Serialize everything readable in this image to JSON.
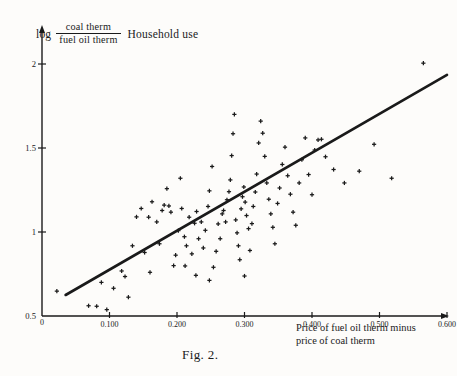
{
  "figure": {
    "caption": "Fig. 2.",
    "title_prefix": "log",
    "title_numerator": "coal therm",
    "title_denominator": "fuel oil therm",
    "title_suffix": "Household use",
    "xlabel_line1": "Price of fuel oil therm minus",
    "xlabel_line2": "price of coal therm",
    "origin_label": "0",
    "ink_color": "#1a1a1a",
    "paper_color": "#fdfcfa"
  },
  "chart_data": {
    "type": "scatter",
    "xlabel": "Price of fuel oil therm minus price of coal therm",
    "ylabel": "log (coal therm / fuel oil therm)",
    "xlim": [
      0.0,
      0.62
    ],
    "ylim": [
      0.5,
      2.12
    ],
    "grid": false,
    "legend": null,
    "xticks": [
      0.1,
      0.2,
      0.3,
      0.4,
      0.5,
      0.6
    ],
    "xtick_labels": [
      "0.100",
      "0.200",
      "0.300",
      "0.400",
      "0.500",
      "0.600"
    ],
    "yticks": [
      0.5,
      1.0,
      1.5,
      2.0
    ],
    "ytick_labels": [
      "0.5",
      "1",
      "1.5",
      "2"
    ],
    "marker": "plus",
    "fit_line": {
      "label": "fitted regression line",
      "x": [
        0.035,
        0.6
      ],
      "y": [
        0.625,
        1.935
      ]
    },
    "points": [
      {
        "x": 0.022,
        "y": 0.648
      },
      {
        "x": 0.069,
        "y": 0.561
      },
      {
        "x": 0.081,
        "y": 0.558
      },
      {
        "x": 0.096,
        "y": 0.538
      },
      {
        "x": 0.088,
        "y": 0.7
      },
      {
        "x": 0.106,
        "y": 0.665
      },
      {
        "x": 0.118,
        "y": 0.768
      },
      {
        "x": 0.123,
        "y": 0.735
      },
      {
        "x": 0.134,
        "y": 0.918
      },
      {
        "x": 0.14,
        "y": 1.09
      },
      {
        "x": 0.147,
        "y": 1.14
      },
      {
        "x": 0.152,
        "y": 0.878
      },
      {
        "x": 0.158,
        "y": 1.088
      },
      {
        "x": 0.163,
        "y": 1.18
      },
      {
        "x": 0.17,
        "y": 1.06
      },
      {
        "x": 0.174,
        "y": 0.93
      },
      {
        "x": 0.178,
        "y": 1.128
      },
      {
        "x": 0.181,
        "y": 1.16
      },
      {
        "x": 0.185,
        "y": 1.258
      },
      {
        "x": 0.188,
        "y": 1.155
      },
      {
        "x": 0.191,
        "y": 1.118
      },
      {
        "x": 0.195,
        "y": 0.8
      },
      {
        "x": 0.198,
        "y": 0.862
      },
      {
        "x": 0.202,
        "y": 1.008
      },
      {
        "x": 0.205,
        "y": 1.32
      },
      {
        "x": 0.207,
        "y": 1.14
      },
      {
        "x": 0.211,
        "y": 0.972
      },
      {
        "x": 0.214,
        "y": 0.918
      },
      {
        "x": 0.218,
        "y": 1.088
      },
      {
        "x": 0.222,
        "y": 0.87
      },
      {
        "x": 0.226,
        "y": 1.052
      },
      {
        "x": 0.229,
        "y": 1.122
      },
      {
        "x": 0.232,
        "y": 0.96
      },
      {
        "x": 0.236,
        "y": 1.06
      },
      {
        "x": 0.239,
        "y": 0.905
      },
      {
        "x": 0.242,
        "y": 1.01
      },
      {
        "x": 0.246,
        "y": 1.152
      },
      {
        "x": 0.248,
        "y": 1.245
      },
      {
        "x": 0.252,
        "y": 1.39
      },
      {
        "x": 0.254,
        "y": 0.79
      },
      {
        "x": 0.258,
        "y": 0.885
      },
      {
        "x": 0.261,
        "y": 1.048
      },
      {
        "x": 0.264,
        "y": 0.96
      },
      {
        "x": 0.267,
        "y": 1.108
      },
      {
        "x": 0.269,
        "y": 1.128
      },
      {
        "x": 0.272,
        "y": 1.06
      },
      {
        "x": 0.274,
        "y": 1.192
      },
      {
        "x": 0.277,
        "y": 1.24
      },
      {
        "x": 0.279,
        "y": 1.31
      },
      {
        "x": 0.281,
        "y": 1.455
      },
      {
        "x": 0.283,
        "y": 1.585
      },
      {
        "x": 0.285,
        "y": 1.7
      },
      {
        "x": 0.287,
        "y": 1.072
      },
      {
        "x": 0.289,
        "y": 0.995
      },
      {
        "x": 0.291,
        "y": 0.918
      },
      {
        "x": 0.293,
        "y": 0.835
      },
      {
        "x": 0.295,
        "y": 1.138
      },
      {
        "x": 0.297,
        "y": 1.21
      },
      {
        "x": 0.299,
        "y": 1.268
      },
      {
        "x": 0.301,
        "y": 1.178
      },
      {
        "x": 0.303,
        "y": 1.098
      },
      {
        "x": 0.306,
        "y": 1.02
      },
      {
        "x": 0.308,
        "y": 0.89
      },
      {
        "x": 0.311,
        "y": 1.05
      },
      {
        "x": 0.313,
        "y": 1.152
      },
      {
        "x": 0.316,
        "y": 1.238
      },
      {
        "x": 0.318,
        "y": 1.345
      },
      {
        "x": 0.321,
        "y": 1.53
      },
      {
        "x": 0.324,
        "y": 1.66
      },
      {
        "x": 0.327,
        "y": 1.588
      },
      {
        "x": 0.33,
        "y": 1.45
      },
      {
        "x": 0.333,
        "y": 1.292
      },
      {
        "x": 0.336,
        "y": 1.195
      },
      {
        "x": 0.339,
        "y": 1.108
      },
      {
        "x": 0.342,
        "y": 1.028
      },
      {
        "x": 0.345,
        "y": 0.93
      },
      {
        "x": 0.349,
        "y": 1.17
      },
      {
        "x": 0.352,
        "y": 1.262
      },
      {
        "x": 0.356,
        "y": 1.402
      },
      {
        "x": 0.36,
        "y": 1.505
      },
      {
        "x": 0.364,
        "y": 1.335
      },
      {
        "x": 0.368,
        "y": 1.225
      },
      {
        "x": 0.372,
        "y": 1.118
      },
      {
        "x": 0.376,
        "y": 1.04
      },
      {
        "x": 0.381,
        "y": 1.292
      },
      {
        "x": 0.385,
        "y": 1.43
      },
      {
        "x": 0.39,
        "y": 1.56
      },
      {
        "x": 0.395,
        "y": 1.342
      },
      {
        "x": 0.4,
        "y": 1.222
      },
      {
        "x": 0.404,
        "y": 1.488
      },
      {
        "x": 0.409,
        "y": 1.548
      },
      {
        "x": 0.414,
        "y": 1.552
      },
      {
        "x": 0.42,
        "y": 1.448
      },
      {
        "x": 0.432,
        "y": 1.372
      },
      {
        "x": 0.448,
        "y": 1.292
      },
      {
        "x": 0.47,
        "y": 1.362
      },
      {
        "x": 0.492,
        "y": 1.522
      },
      {
        "x": 0.518,
        "y": 1.32
      },
      {
        "x": 0.565,
        "y": 2.005
      },
      {
        "x": 0.16,
        "y": 0.76
      },
      {
        "x": 0.128,
        "y": 0.612
      },
      {
        "x": 0.228,
        "y": 0.742
      },
      {
        "x": 0.248,
        "y": 0.712
      },
      {
        "x": 0.212,
        "y": 0.798
      },
      {
        "x": 0.3,
        "y": 0.738
      }
    ]
  }
}
